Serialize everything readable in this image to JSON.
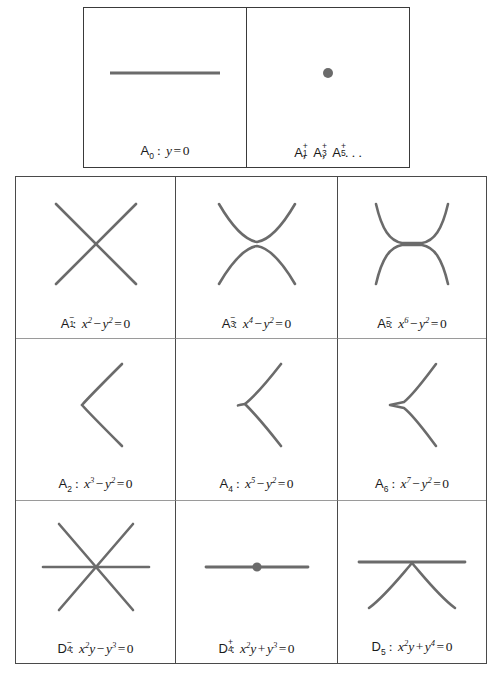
{
  "figure": {
    "kind": "singularity-classification-table",
    "curve_color": "#6b6b6b",
    "border_color": "#4a4a4a",
    "background": "#ffffff"
  },
  "top_row": {
    "cells": [
      {
        "id": "A0",
        "shape": "horizontal-line",
        "class_label": "A",
        "class_sub": "0",
        "class_sup": "",
        "separator": ":",
        "equation": "y = 0",
        "equation_parts": [
          {
            "text": "y",
            "style": "italic"
          },
          {
            "text": "=",
            "style": "op"
          },
          {
            "text": "0",
            "style": "roman"
          }
        ]
      },
      {
        "id": "A_plus_series",
        "shape": "isolated-point",
        "class_label": "A",
        "class_sub": "1",
        "class_sup": "+",
        "separator": "",
        "equation": "",
        "series_text": "A1+, A3+, A5+, ...",
        "series": [
          {
            "label": "A",
            "sub": "1",
            "sup": "+"
          },
          {
            "label": "A",
            "sub": "3",
            "sup": "+"
          },
          {
            "label": "A",
            "sub": "5",
            "sup": "+"
          }
        ],
        "ellipsis": ". . ."
      }
    ]
  },
  "grid": {
    "rows": 3,
    "cols": 3,
    "cells": [
      {
        "id": "A1minus",
        "shape": "node-crossing-lines",
        "class_label": "A",
        "class_sub": "1",
        "class_sup": "−",
        "separator": ":",
        "equation": "x2 − y2 = 0",
        "equation_parts": [
          {
            "text": "x",
            "style": "italic",
            "sup": "2"
          },
          {
            "text": "−",
            "style": "op"
          },
          {
            "text": "y",
            "style": "italic",
            "sup": "2"
          },
          {
            "text": "=",
            "style": "op"
          },
          {
            "text": "0",
            "style": "roman"
          }
        ]
      },
      {
        "id": "A3minus",
        "shape": "tacnode",
        "class_label": "A",
        "class_sub": "3",
        "class_sup": "−",
        "separator": ":",
        "equation": "x4 − y2 = 0",
        "equation_parts": [
          {
            "text": "x",
            "style": "italic",
            "sup": "4"
          },
          {
            "text": "−",
            "style": "op"
          },
          {
            "text": "y",
            "style": "italic",
            "sup": "2"
          },
          {
            "text": "=",
            "style": "op"
          },
          {
            "text": "0",
            "style": "roman"
          }
        ]
      },
      {
        "id": "A5minus",
        "shape": "higher-tacnode",
        "class_label": "A",
        "class_sub": "5",
        "class_sup": "−",
        "separator": ":",
        "equation": "x6 − y2 = 0",
        "equation_parts": [
          {
            "text": "x",
            "style": "italic",
            "sup": "6"
          },
          {
            "text": "−",
            "style": "op"
          },
          {
            "text": "y",
            "style": "italic",
            "sup": "2"
          },
          {
            "text": "=",
            "style": "op"
          },
          {
            "text": "0",
            "style": "roman"
          }
        ]
      },
      {
        "id": "A2",
        "shape": "cusp",
        "class_label": "A",
        "class_sub": "2",
        "class_sup": "",
        "separator": ":",
        "equation": "x3 − y2 = 0",
        "equation_parts": [
          {
            "text": "x",
            "style": "italic",
            "sup": "3"
          },
          {
            "text": "−",
            "style": "op"
          },
          {
            "text": "y",
            "style": "italic",
            "sup": "2"
          },
          {
            "text": "=",
            "style": "op"
          },
          {
            "text": "0",
            "style": "roman"
          }
        ]
      },
      {
        "id": "A4",
        "shape": "ramphoid-cusp",
        "class_label": "A",
        "class_sub": "4",
        "class_sup": "",
        "separator": ":",
        "equation": "x5 − y2 = 0",
        "equation_parts": [
          {
            "text": "x",
            "style": "italic",
            "sup": "5"
          },
          {
            "text": "−",
            "style": "op"
          },
          {
            "text": "y",
            "style": "italic",
            "sup": "2"
          },
          {
            "text": "=",
            "style": "op"
          },
          {
            "text": "0",
            "style": "roman"
          }
        ]
      },
      {
        "id": "A6",
        "shape": "flat-cusp",
        "class_label": "A",
        "class_sub": "6",
        "class_sup": "",
        "separator": ":",
        "equation": "x7 − y2 = 0",
        "equation_parts": [
          {
            "text": "x",
            "style": "italic",
            "sup": "7"
          },
          {
            "text": "−",
            "style": "op"
          },
          {
            "text": "y",
            "style": "italic",
            "sup": "2"
          },
          {
            "text": "=",
            "style": "op"
          },
          {
            "text": "0",
            "style": "roman"
          }
        ]
      },
      {
        "id": "D4minus",
        "shape": "triple-point-three-lines",
        "class_label": "D",
        "class_sub": "4",
        "class_sup": "−",
        "separator": ":",
        "equation": "x2y − y3 = 0",
        "equation_parts": [
          {
            "text": "x",
            "style": "italic",
            "sup": "2"
          },
          {
            "text": "y",
            "style": "italic-tight"
          },
          {
            "text": "−",
            "style": "op"
          },
          {
            "text": "y",
            "style": "italic",
            "sup": "3"
          },
          {
            "text": "=",
            "style": "op"
          },
          {
            "text": "0",
            "style": "roman"
          }
        ]
      },
      {
        "id": "D4plus",
        "shape": "line-with-isolated-point",
        "class_label": "D",
        "class_sub": "4",
        "class_sup": "+",
        "separator": ":",
        "equation": "x2y + y3 = 0",
        "equation_parts": [
          {
            "text": "x",
            "style": "italic",
            "sup": "2"
          },
          {
            "text": "y",
            "style": "italic-tight"
          },
          {
            "text": "+",
            "style": "op"
          },
          {
            "text": "y",
            "style": "italic",
            "sup": "3"
          },
          {
            "text": "=",
            "style": "op"
          },
          {
            "text": "0",
            "style": "roman"
          }
        ]
      },
      {
        "id": "D5",
        "shape": "line-with-cusp",
        "class_label": "D",
        "class_sub": "5",
        "class_sup": "",
        "separator": ":",
        "equation": "x2y + y4 = 0",
        "equation_parts": [
          {
            "text": "x",
            "style": "italic",
            "sup": "2"
          },
          {
            "text": "y",
            "style": "italic-tight"
          },
          {
            "text": "+",
            "style": "op"
          },
          {
            "text": "y",
            "style": "italic",
            "sup": "4"
          },
          {
            "text": "=",
            "style": "op"
          },
          {
            "text": "0",
            "style": "roman"
          }
        ]
      }
    ]
  }
}
